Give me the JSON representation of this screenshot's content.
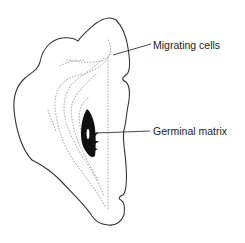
{
  "diagram": {
    "type": "anatomical-section",
    "labels": {
      "migrating_cells": "Migrating cells",
      "germinal_matrix": "Germinal matrix"
    },
    "colors": {
      "outline": "#333333",
      "dots": "#9a9a9a",
      "germinal_matrix": "#111111",
      "background": "#ffffff"
    }
  }
}
